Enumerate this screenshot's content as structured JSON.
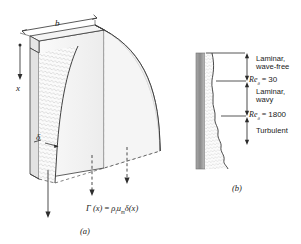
{
  "figure": {
    "type": "technical-diagram",
    "background_color": "#ffffff",
    "ink_color": "#1a1a1a",
    "wall_color": "#8f8f8f",
    "film_tint": "#f2f2f2"
  },
  "panel_a": {
    "caption": "(a)",
    "labels": {
      "width_b": "b",
      "axis_x": "x",
      "film_thickness": "δ"
    },
    "equation": {
      "lhs": "Γ (x)",
      "equals": "=",
      "rho": "ρ",
      "rho_sub": "l",
      "u": "u",
      "u_sub": "m",
      "delta": "δ",
      "arg": "(x)",
      "full": "Γ (x) = ρₗ uₘ δ(x)"
    },
    "flow_arrows": 3
  },
  "panel_b": {
    "caption": "(b)",
    "regimes": [
      {
        "name": "regime-laminar-wave-free",
        "line1": "Laminar,",
        "line2": "wave-free"
      },
      {
        "name": "regime-laminar-wavy",
        "line1": "Laminar,",
        "line2": "wavy"
      },
      {
        "name": "regime-turbulent",
        "line1": "Turbulent",
        "line2": ""
      }
    ],
    "transitions": [
      {
        "name": "transition-re-30",
        "symbol": "Re",
        "sub": "δ",
        "equals": "=",
        "value": "30"
      },
      {
        "name": "transition-re-1800",
        "symbol": "Re",
        "sub": "δ",
        "equals": "=",
        "value": "1800"
      }
    ]
  }
}
